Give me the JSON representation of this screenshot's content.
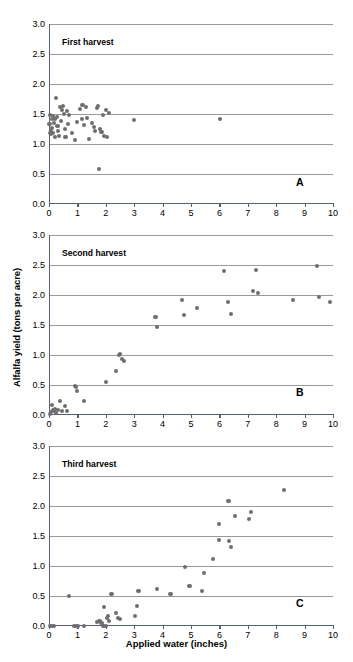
{
  "figure": {
    "x_axis_title": "Applied water (inches)",
    "y_axis_title": "Alfalfa yield (tons per acre)"
  },
  "panels": [
    {
      "key": "A",
      "title": "First harvest",
      "letter": "A"
    },
    {
      "key": "B",
      "title": "Second harvest",
      "letter": "B"
    },
    {
      "key": "C",
      "title": "Third harvest",
      "letter": "C"
    }
  ],
  "axis": {
    "x_ticks": [
      "0",
      "1",
      "2",
      "3",
      "4",
      "5",
      "6",
      "7",
      "8",
      "9",
      "10"
    ],
    "y_ticks": [
      "0.0",
      "0.5",
      "1.0",
      "1.5",
      "2.0",
      "2.5",
      "3.0"
    ],
    "xlim": [
      0,
      10
    ],
    "ylim": [
      0,
      3
    ],
    "grid": true,
    "dot_color": "#6e6e6e",
    "grid_color": "#9a9a9a",
    "axis_color": "#555f7a"
  },
  "chart_data": [
    {
      "type": "scatter",
      "title": "First harvest",
      "panel": "A",
      "xlabel": "Applied water (inches)",
      "ylabel": "Alfalfa yield (tons per acre)",
      "xlim": [
        0,
        10
      ],
      "ylim": [
        0,
        3
      ],
      "grid": true,
      "legend": null,
      "points": [
        [
          0.02,
          1.33
        ],
        [
          0.04,
          1.48
        ],
        [
          0.05,
          1.19
        ],
        [
          0.06,
          1.21
        ],
        [
          0.08,
          1.16
        ],
        [
          0.1,
          1.42
        ],
        [
          0.11,
          1.26
        ],
        [
          0.13,
          1.18
        ],
        [
          0.15,
          1.47
        ],
        [
          0.18,
          1.35
        ],
        [
          0.2,
          1.12
        ],
        [
          0.22,
          1.41
        ],
        [
          0.25,
          1.76
        ],
        [
          0.28,
          1.45
        ],
        [
          0.3,
          1.3
        ],
        [
          0.33,
          1.22
        ],
        [
          0.36,
          1.13
        ],
        [
          0.4,
          1.62
        ],
        [
          0.43,
          1.39
        ],
        [
          0.46,
          1.56
        ],
        [
          0.5,
          1.63
        ],
        [
          0.52,
          1.5
        ],
        [
          0.55,
          1.25
        ],
        [
          0.58,
          1.11
        ],
        [
          0.62,
          1.55
        ],
        [
          0.66,
          1.33
        ],
        [
          0.7,
          1.49
        ],
        [
          0.8,
          1.18
        ],
        [
          0.92,
          1.07
        ],
        [
          1.0,
          1.37
        ],
        [
          1.08,
          1.58
        ],
        [
          1.15,
          1.41
        ],
        [
          1.18,
          1.65
        ],
        [
          1.24,
          1.31
        ],
        [
          1.3,
          1.62
        ],
        [
          1.35,
          1.43
        ],
        [
          1.42,
          1.08
        ],
        [
          1.5,
          1.35
        ],
        [
          1.58,
          1.29
        ],
        [
          1.62,
          1.21
        ],
        [
          1.7,
          1.6
        ],
        [
          1.72,
          1.63
        ],
        [
          1.75,
          0.59
        ],
        [
          1.8,
          1.25
        ],
        [
          1.85,
          1.2
        ],
        [
          1.9,
          1.49
        ],
        [
          1.95,
          1.14
        ],
        [
          2.0,
          1.56
        ],
        [
          2.05,
          1.12
        ],
        [
          2.1,
          1.51
        ],
        [
          3.0,
          1.4
        ],
        [
          6.02,
          1.42
        ]
      ]
    },
    {
      "type": "scatter",
      "title": "Second harvest",
      "panel": "B",
      "xlabel": "Applied water (inches)",
      "ylabel": "Alfalfa yield (tons per acre)",
      "xlim": [
        0,
        10
      ],
      "ylim": [
        0,
        3
      ],
      "grid": true,
      "legend": null,
      "points": [
        [
          0.03,
          0.02
        ],
        [
          0.06,
          0.05
        ],
        [
          0.1,
          0.17
        ],
        [
          0.14,
          0.08
        ],
        [
          0.18,
          0.06
        ],
        [
          0.22,
          0.1
        ],
        [
          0.26,
          0.04
        ],
        [
          0.32,
          0.09
        ],
        [
          0.38,
          0.24
        ],
        [
          0.45,
          0.07
        ],
        [
          0.55,
          0.15
        ],
        [
          0.62,
          0.06
        ],
        [
          0.92,
          0.49
        ],
        [
          0.96,
          0.47
        ],
        [
          1.0,
          0.4
        ],
        [
          1.24,
          0.24
        ],
        [
          2.02,
          0.55
        ],
        [
          2.35,
          0.73
        ],
        [
          2.47,
          1.0
        ],
        [
          2.5,
          1.02
        ],
        [
          2.58,
          0.93
        ],
        [
          2.63,
          0.9
        ],
        [
          3.75,
          1.63
        ],
        [
          3.8,
          1.47
        ],
        [
          4.68,
          1.91
        ],
        [
          4.75,
          1.66
        ],
        [
          5.22,
          1.78
        ],
        [
          6.15,
          2.4
        ],
        [
          6.3,
          1.88
        ],
        [
          6.4,
          1.68
        ],
        [
          7.18,
          2.06
        ],
        [
          7.3,
          2.41
        ],
        [
          7.35,
          2.04
        ],
        [
          8.58,
          1.92
        ],
        [
          9.45,
          2.49
        ],
        [
          9.52,
          1.96
        ],
        [
          9.9,
          1.89
        ]
      ]
    },
    {
      "type": "scatter",
      "title": "Third harvest",
      "panel": "C",
      "xlabel": "Applied water (inches)",
      "ylabel": "Alfalfa yield (tons per acre)",
      "xlim": [
        0,
        10
      ],
      "ylim": [
        0,
        3
      ],
      "grid": true,
      "legend": null,
      "points": [
        [
          0.03,
          0.0
        ],
        [
          0.1,
          0.0
        ],
        [
          0.18,
          0.0
        ],
        [
          0.7,
          0.5
        ],
        [
          0.88,
          0.0
        ],
        [
          0.95,
          0.0
        ],
        [
          1.02,
          0.0
        ],
        [
          1.22,
          0.0
        ],
        [
          1.7,
          0.07
        ],
        [
          1.78,
          0.09
        ],
        [
          1.85,
          0.05
        ],
        [
          1.92,
          0.0
        ],
        [
          1.95,
          0.32
        ],
        [
          2.0,
          0.0
        ],
        [
          2.05,
          0.13
        ],
        [
          2.08,
          0.16
        ],
        [
          2.12,
          0.08
        ],
        [
          2.2,
          0.54
        ],
        [
          2.35,
          0.22
        ],
        [
          2.42,
          0.13
        ],
        [
          2.5,
          0.11
        ],
        [
          3.02,
          0.16
        ],
        [
          3.1,
          0.33
        ],
        [
          3.15,
          0.59
        ],
        [
          3.8,
          0.62
        ],
        [
          4.28,
          0.53
        ],
        [
          4.78,
          0.99
        ],
        [
          4.95,
          0.66
        ],
        [
          5.38,
          0.58
        ],
        [
          5.45,
          0.89
        ],
        [
          5.78,
          1.12
        ],
        [
          5.98,
          1.7
        ],
        [
          6.0,
          1.43
        ],
        [
          6.32,
          2.09
        ],
        [
          6.35,
          1.42
        ],
        [
          6.42,
          1.31
        ],
        [
          6.55,
          1.84
        ],
        [
          7.05,
          1.78
        ],
        [
          7.12,
          1.9
        ],
        [
          8.28,
          2.26
        ]
      ]
    }
  ]
}
